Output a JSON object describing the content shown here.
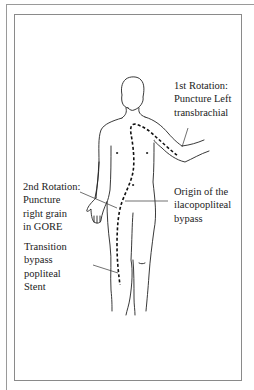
{
  "figure": {
    "type": "anatomical-diagram",
    "colors": {
      "line": "#222222",
      "frame": "#8a8a8a",
      "background": "#ffffff"
    },
    "labels": [
      {
        "id": "first-rotation",
        "lines": [
          "1st Rotation:",
          "Puncture Left",
          "transbrachial"
        ]
      },
      {
        "id": "second-rotation",
        "lines": [
          "2nd Rotation:",
          "Puncture",
          "right grain",
          "in GORE"
        ]
      },
      {
        "id": "origin-bypass",
        "lines": [
          "Origin of the",
          "ilacopopliteal",
          "bypass"
        ]
      },
      {
        "id": "transition-stent",
        "lines": [
          "Transition",
          "bypass",
          "popliteal",
          "Stent"
        ]
      }
    ]
  }
}
